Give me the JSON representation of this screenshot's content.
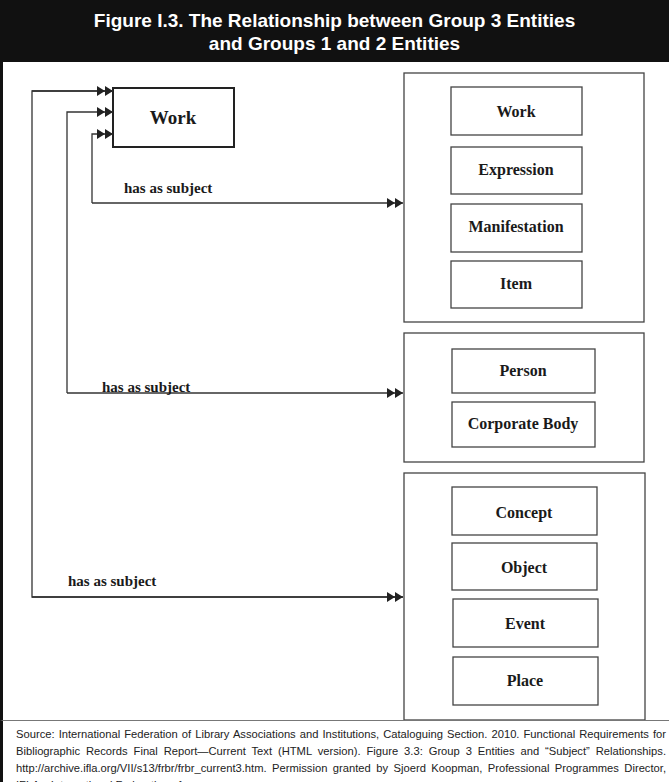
{
  "figure": {
    "title_line1": "Figure I.3.  The Relationship between Group 3 Entities",
    "title_line2": "and Groups 1 and 2 Entities"
  },
  "diagram": {
    "source_entity": "Work",
    "relationship_label": "has as subject",
    "groups": [
      {
        "name": "group1",
        "relationship": "has as subject",
        "entities": [
          "Work",
          "Expression",
          "Manifestation",
          "Item"
        ]
      },
      {
        "name": "group2",
        "relationship": "has as subject",
        "entities": [
          "Person",
          "Corporate Body"
        ]
      },
      {
        "name": "group3",
        "relationship": "has as subject",
        "entities": [
          "Concept",
          "Object",
          "Event",
          "Place"
        ]
      }
    ],
    "colors": {
      "header_bg": "#111111",
      "header_text": "#ffffff",
      "line": "#333333"
    }
  },
  "footer": {
    "source_text": "Source: International Federation of Library Associations and Institutions, Cataloguing Section. 2010. Functional Requirements for Bibliographic Records Final Report—Current Text (HTML version). Figure 3.3: Group 3 Entities and “Subject” Relationships. http://archive.ifla.org/VII/s13/frbr/frbr_current3.htm. Permission granted by Sjoerd Koopman, Professional Programmes Director, IFLA—International Federation of"
  }
}
